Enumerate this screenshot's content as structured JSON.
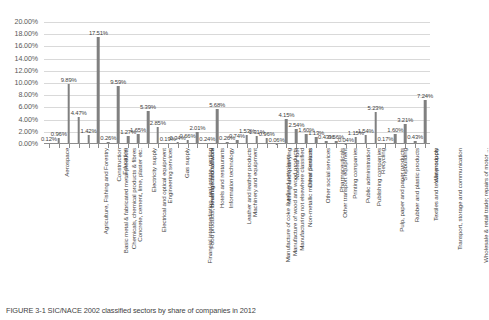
{
  "chart_data": {
    "type": "bar",
    "title": "",
    "xlabel": "",
    "ylabel": "",
    "ylim": [
      0,
      20
    ],
    "ytick_labels": [
      "0.00%",
      "2.00%",
      "4.00%",
      "6.00%",
      "8.00%",
      "10.00%",
      "12.00%",
      "14.00%",
      "16.00%",
      "18.00%",
      "20.00%"
    ],
    "ytick_values": [
      0,
      2,
      4,
      6,
      8,
      10,
      12,
      14,
      16,
      18,
      20
    ],
    "grid": true,
    "legend": "none",
    "bar_color": "#808080",
    "grid_color": "#d9d9d9",
    "categories": [
      "Aerospace",
      "Agriculture, Fishing and Forestry",
      "Basic metal & fabricated metal products",
      "Chemicals, chemical products & fibres",
      "Concrete, cement, lime, plaster etc.",
      "Construction",
      "Education",
      "Electrical and optical equipment",
      "Electricity supply",
      "Engineering services",
      "Financial intermediation, real estate, renting",
      "Food products, beverage and tobacco",
      "Gas supply",
      "Health and social work",
      "Hotels and restaurants",
      "Information technology",
      "Leather and leather products",
      "Machinery and equipment",
      "Manufacture of coke & refined petroleum ...",
      "Manufacture of wood and wood products",
      "Manufacturing not elsewhere classified",
      "Mining and quarrying",
      "Non-metallic mineral products",
      "Nuclear fuel",
      "Other Services",
      "Other social services",
      "Other transport equipment",
      "Pharmaceuticals",
      "Printing companies",
      "Public administration",
      "Publishing companies",
      "Pulp, paper and paper products",
      "Recycling",
      "Rubber and plastic products",
      "Shipbuilding",
      "Textiles and textile products",
      "Transport, storage and communication",
      "Water supply",
      "Wholesale & retail trade; repairs of motor ..."
    ],
    "values": [
      0.12,
      0.96,
      9.89,
      4.47,
      1.42,
      17.51,
      0.26,
      9.59,
      1.27,
      1.65,
      5.39,
      2.85,
      0.19,
      0.34,
      0.66,
      2.01,
      0.24,
      5.68,
      0.26,
      0.74,
      1.53,
      1.31,
      0.96,
      0.06,
      4.15,
      2.54,
      1.6,
      1.13,
      0.43,
      0.56,
      0.04,
      1.15,
      1.54,
      5.23,
      0.17,
      1.6,
      3.21,
      0.43,
      7.24
    ],
    "value_labels": [
      "0.12%",
      "0.96%",
      "9.89%",
      "4.47%",
      "1.42%",
      "17.51%",
      "0.26%",
      "9.59%",
      "1.27%",
      "1.65%",
      "5.39%",
      "2.85%",
      "0.19%",
      "0.34%",
      "0.66%",
      "2.01%",
      "0.24%",
      "5.68%",
      "0.26%",
      "0.74%",
      "1.53%",
      "1.31%",
      "0.96%",
      "0.06%",
      "4.15%",
      "2.54%",
      "1.60%",
      "1.13%",
      "0.43%",
      "0.56%",
      "0.04%",
      "1.15%",
      "1.54%",
      "5.23%",
      "0.17%",
      "1.60%",
      "3.21%",
      "0.43%",
      "7.24%"
    ]
  },
  "caption": {
    "text": "FIGURE 3-1   SIC/NACE 2002 classified sectors by share of companies in 2012"
  }
}
